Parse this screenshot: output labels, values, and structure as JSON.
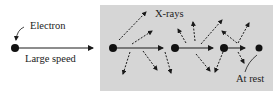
{
  "labels": {
    "electron": "Electron",
    "speed": "Large speed",
    "xrays": "X-rays",
    "at_rest": "At rest"
  },
  "colors": {
    "panel": "#d6d6d6",
    "ink": "#1a1a1a",
    "background": "#ffffff"
  }
}
